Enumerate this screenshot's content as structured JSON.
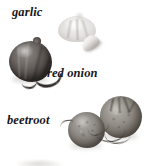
{
  "figure": {
    "kind": "produce-photo-plate",
    "background_color": "#ffffff",
    "label_color": "#17161a",
    "width_px": 146,
    "height_px": 166
  },
  "labels": [
    {
      "id": "garlic",
      "text": "garlic",
      "style": "italic-serif"
    },
    {
      "id": "red-onion",
      "text": "red onion",
      "style": "italic-serif"
    },
    {
      "id": "beetroot",
      "text": "beetroot",
      "style": "italic-serif"
    }
  ],
  "specimens": [
    {
      "id": "garlic-bulb",
      "name": "garlic bulb",
      "tone": "#e2e0de",
      "description": "pale papery whole bulb, soft faded edges"
    },
    {
      "id": "garlic-clove",
      "name": "garlic clove",
      "tone": "#d9d5d1",
      "description": "single crescent-shaped clove beside the bulb"
    },
    {
      "id": "red-onion-bulb",
      "name": "red onion bulb",
      "tone": "#514b48",
      "description": "dark glossy round onion with vertical skin striations"
    },
    {
      "id": "red-onion-tail",
      "name": "red onion root tail",
      "tone": "#2f2a27",
      "description": "curved dark dried root trailing to the lower right"
    },
    {
      "id": "beet-small-bulb",
      "name": "small beetroot",
      "tone": "#918d88",
      "description": "mottled round beet in front-left of the pair"
    },
    {
      "id": "beet-large-bulb",
      "name": "large beetroot",
      "tone": "#96918b",
      "description": "larger beet behind right, rough scarred crown"
    },
    {
      "id": "beet-roots",
      "name": "beetroot root strands",
      "tone": "#3c372f",
      "description": "thin crossing tap roots between the two beets"
    }
  ]
}
